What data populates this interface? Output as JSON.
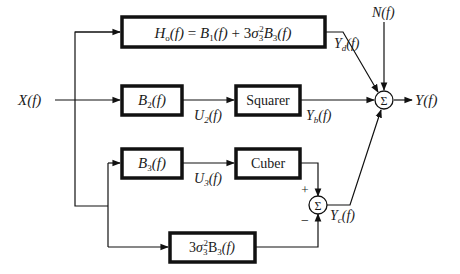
{
  "diagram": {
    "input_label": "X(f)",
    "output_label": "Y(f)",
    "noise_label": "N(f)",
    "blocks": {
      "h0": {
        "text": "Ho(f) = B1(f) + 3σ3²B3(f)",
        "output_label": "Yd(f)"
      },
      "b2": {
        "text": "B2(f)",
        "output_label": "U2(f)"
      },
      "squarer": {
        "text": "Squarer",
        "output_label": "Yb(f)"
      },
      "b3": {
        "text": "B3(f)",
        "output_label": "U3(f)"
      },
      "cuber": {
        "text": "Cuber"
      },
      "b3_scaled": {
        "text": "3σ3²B3(f)"
      }
    },
    "summers": {
      "main": {
        "symbol": "Σ"
      },
      "inner": {
        "symbol": "Σ",
        "plus_sign": "+",
        "minus_sign": "−",
        "output_label": "Yc(f)"
      }
    }
  }
}
